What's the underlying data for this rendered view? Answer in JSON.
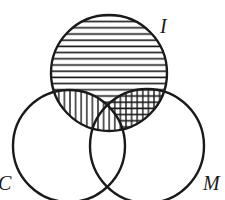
{
  "diagram": {
    "type": "venn",
    "sets": [
      {
        "id": "I",
        "label": "I",
        "cx": 109,
        "cy": 73,
        "r": 58
      },
      {
        "id": "C",
        "label": "C",
        "cx": 69,
        "cy": 146,
        "r": 56
      },
      {
        "id": "M",
        "label": "M",
        "cx": 147,
        "cy": 146,
        "r": 57
      }
    ],
    "shading": [
      {
        "region": "I minus C",
        "pattern": "horizontal-lines"
      },
      {
        "region": "I and C, not M",
        "pattern": "vertical-lines"
      },
      {
        "region": "I and M",
        "pattern": "crosshatch"
      }
    ],
    "stroke_color": "#1a1a1a",
    "background_color": "#ffffff"
  }
}
